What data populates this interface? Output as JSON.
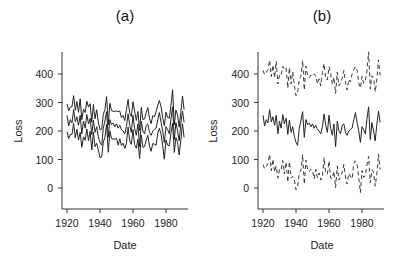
{
  "chart_data": [
    {
      "type": "line",
      "title": "(a)",
      "xlabel": "Date",
      "ylabel": "Loss",
      "xticks": [
        1920,
        1940,
        1960,
        1980
      ],
      "yticks": [
        0,
        100,
        200,
        300,
        400
      ],
      "xlim": [
        1917,
        1994
      ],
      "ylim": [
        -75,
        475
      ],
      "grid": false,
      "legend": null,
      "x_start": 1920,
      "series": [
        {
          "name": "upper band",
          "style": "solid",
          "offset": 50
        },
        {
          "name": "estimate",
          "style": "solid",
          "offset": 0
        },
        {
          "name": "lower band",
          "style": "solid",
          "offset": -50
        }
      ]
    },
    {
      "type": "line",
      "title": "(b)",
      "xlabel": "Date",
      "ylabel": "Loss",
      "xticks": [
        1920,
        1940,
        1960,
        1980
      ],
      "yticks": [
        0,
        100,
        200,
        300,
        400
      ],
      "xlim": [
        1917,
        1994
      ],
      "ylim": [
        -75,
        475
      ],
      "grid": false,
      "legend": null,
      "x_start": 1920,
      "series": [
        {
          "name": "upper interval",
          "style": "dashed",
          "offset": 175
        },
        {
          "name": "estimate",
          "style": "solid",
          "offset": 0
        },
        {
          "name": "lower interval",
          "style": "dashed",
          "offset": -160
        }
      ]
    }
  ],
  "base_series": [
    255,
    218,
    240,
    228,
    275,
    232,
    250,
    220,
    255,
    190,
    235,
    210,
    258,
    225,
    245,
    188,
    238,
    195,
    215,
    180,
    160,
    150,
    210,
    235,
    268,
    178,
    240,
    222,
    228,
    215,
    225,
    210,
    220,
    205,
    200,
    190,
    215,
    260,
    220,
    195,
    255,
    210,
    185,
    225,
    145,
    235,
    200,
    190,
    220,
    225,
    195,
    185,
    200,
    205,
    210,
    240,
    265,
    230,
    200,
    160,
    215,
    205,
    190,
    240,
    285,
    170,
    230,
    200,
    165,
    225,
    270,
    230
  ],
  "panels": {
    "a": {
      "title": "(a)"
    },
    "b": {
      "title": "(b)"
    }
  }
}
